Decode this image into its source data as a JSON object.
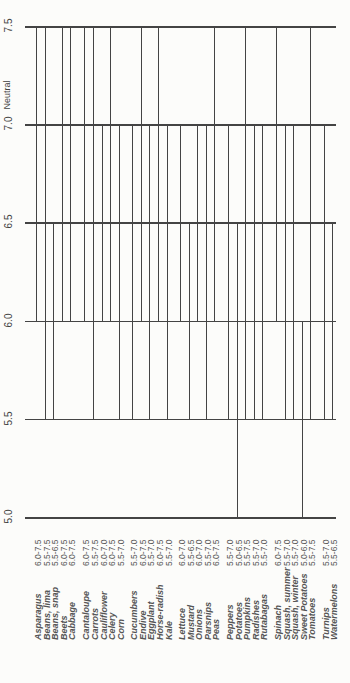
{
  "chart_data": {
    "type": "bar",
    "orientation": "range-bars (rotated)",
    "title": "",
    "xlabel": "",
    "ylabel": "pH",
    "axis_annotation": "Neutral",
    "axis_ticks": [
      "5.0",
      "5.5",
      "6.0",
      "6.5",
      "7.0",
      "7.5"
    ],
    "ylim": [
      5.0,
      7.5
    ],
    "categories": [
      "Asparagus",
      "Beans, lima",
      "Beans, snap",
      "Beets",
      "Cabbage",
      "Cantaloupe",
      "Carrots",
      "Cauliflower",
      "Celery",
      "Corn",
      "Cucumbers",
      "Endive",
      "Eggplant",
      "Horse-radish",
      "Kale",
      "Lettuce",
      "Mustard",
      "Onions",
      "Parsnips",
      "Peas",
      "Peppers",
      "Potatoes",
      "Pumpkins",
      "Radishes",
      "Rutabagas",
      "Spinach",
      "Squash, summer",
      "Squash, winter",
      "Sweet Potatoes",
      "Tomatoes",
      "Turnips",
      "Watermelons"
    ],
    "ranges": [
      "6.0-7.5",
      "5.5-7.5",
      "5.5-6.5",
      "6.0-7.5",
      "6.0-7.5",
      "6.0-7.5",
      "5.5-7.5",
      "6.0-7.0",
      "6.0-7.5",
      "5.5-7.0",
      "5.5-7.0",
      "6.0-7.5",
      "5.5-7.0",
      "6.0-7.5",
      "5.5-7.0",
      "6.0-7.0",
      "5.5-6.5",
      "6.0-7.0",
      "5.5-7.0",
      "6.0-7.5",
      "5.5-7.0",
      "5.0-6.5",
      "5.5-7.5",
      "5.5-7.0",
      "5.5-7.0",
      "6.0-7.5",
      "5.5-7.0",
      "5.5-7.0",
      "5.0-6.0",
      "5.5-7.5",
      "5.5-7.0",
      "5.5-6.5"
    ],
    "series": [
      {
        "name": "min pH",
        "values": [
          6.0,
          5.5,
          5.5,
          6.0,
          6.0,
          6.0,
          5.5,
          6.0,
          6.0,
          5.5,
          5.5,
          6.0,
          5.5,
          6.0,
          5.5,
          6.0,
          5.5,
          6.0,
          5.5,
          6.0,
          5.5,
          5.0,
          5.5,
          5.5,
          5.5,
          6.0,
          5.5,
          5.5,
          5.0,
          5.5,
          5.5,
          5.5
        ]
      },
      {
        "name": "max pH",
        "values": [
          7.5,
          7.5,
          6.5,
          7.5,
          7.5,
          7.5,
          7.5,
          7.0,
          7.5,
          7.0,
          7.0,
          7.5,
          7.0,
          7.5,
          7.0,
          7.0,
          6.5,
          7.0,
          7.0,
          7.5,
          7.0,
          6.5,
          7.5,
          7.0,
          7.0,
          7.5,
          7.0,
          7.0,
          6.0,
          7.5,
          7.0,
          6.5
        ]
      }
    ],
    "groups": [
      5,
      5,
      5,
      5,
      5,
      5,
      2
    ],
    "grid": true,
    "legend": "none"
  },
  "layout": {
    "px_per_unit": 196.4,
    "y_at_5": 517,
    "x_start": 27,
    "x_end": 336,
    "label_x": [
      38,
      47,
      55,
      64,
      72,
      86,
      95,
      104,
      112,
      121,
      134,
      143,
      151,
      160,
      169,
      182,
      191,
      199,
      208,
      216,
      230,
      239,
      247,
      256,
      264,
      278,
      287,
      295,
      304,
      312,
      326,
      334
    ]
  }
}
